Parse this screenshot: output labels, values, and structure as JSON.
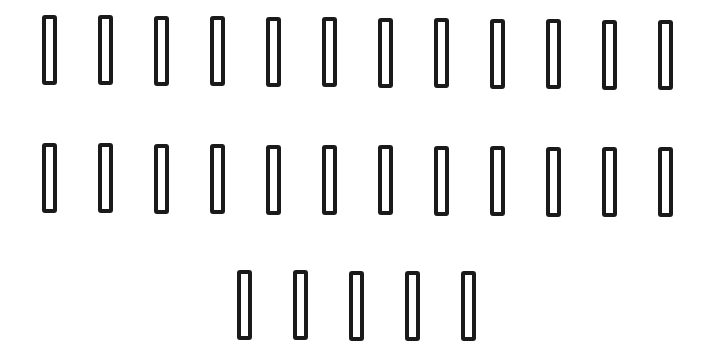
{
  "rows": [
    {
      "count": 12,
      "glyphs": [
        "□",
        "□",
        "□",
        "□",
        "□",
        "□",
        "□",
        "□",
        "□",
        "□",
        "□",
        "□"
      ]
    },
    {
      "count": 12,
      "glyphs": [
        "□",
        "□",
        "□",
        "□",
        "□",
        "□",
        "□",
        "□",
        "□",
        "□",
        "□",
        "□"
      ]
    },
    {
      "count": 5,
      "glyphs": [
        "□",
        "□",
        "□",
        "□",
        "□"
      ]
    }
  ],
  "colors": {
    "glyph_stroke": "#1a1a1a",
    "background": "#ffffff"
  }
}
